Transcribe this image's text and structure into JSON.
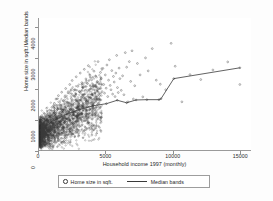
{
  "chart_data": {
    "type": "scatter",
    "title": "",
    "xlabel": "Household income 1997 (monthly)",
    "ylabel": "Home size in sqft./Median bands",
    "xlim": [
      0,
      15800
    ],
    "ylim": [
      0,
      4300
    ],
    "xticks": [
      0,
      5000,
      10000,
      15000
    ],
    "xtick_labels": [
      "0",
      "5000",
      "10000",
      "15000"
    ],
    "yticks": [
      0,
      1000,
      2000,
      3000,
      4000
    ],
    "ytick_labels": [
      "0",
      "1000",
      "2000",
      "3000",
      "4000"
    ],
    "grid": false,
    "legend_position": "below-axes",
    "series": [
      {
        "name": "Home size in sqft.",
        "type": "scatter",
        "marker": "open-circle",
        "color": "#3a3a3a",
        "note": "Dense cloud concentrated at low incomes (0-4000) with home sizes mostly 300-2600 sqft, fanning upward and rightward; sparse outliers extend to ~3800 sqft and incomes to ~15000."
      },
      {
        "name": "Median bands",
        "type": "line",
        "color": "#3a3a3a",
        "x": [
          150,
          1000,
          2000,
          3000,
          4000,
          5000,
          5800,
          6500,
          7200,
          8000,
          8900,
          9050,
          10000,
          14900
        ],
        "y": [
          690,
          960,
          1180,
          1340,
          1460,
          1530,
          1640,
          1560,
          1650,
          1660,
          1660,
          1690,
          2340,
          2690
        ]
      }
    ],
    "scatter_points": {
      "x": [
        120,
        180,
        240,
        300,
        360,
        420,
        480,
        540,
        600,
        660,
        720,
        780,
        840,
        900,
        960,
        1020,
        1080,
        1140,
        1200,
        1260,
        1320,
        1380,
        1440,
        1500,
        1560,
        1620,
        1680,
        1740,
        1800,
        1860,
        1920,
        1980,
        2040,
        2100,
        2160,
        2220,
        2280,
        2340,
        2400,
        2460,
        2520,
        2580,
        2640,
        2700,
        2760,
        2820,
        2880,
        2940,
        3000,
        3060,
        3120,
        3180,
        3240,
        3300,
        3360,
        3420,
        3480,
        3540,
        3600,
        3660,
        3720,
        3780,
        3840,
        3900,
        3960,
        4020,
        4080,
        4140,
        4200,
        4260,
        4320,
        4380,
        4440,
        4500,
        4560,
        4620,
        4680,
        4740,
        4800,
        4860,
        4920,
        4980,
        5040,
        5100,
        5160,
        5220,
        5280,
        5340,
        5400,
        5460,
        5520,
        5580,
        5640,
        5700,
        5760,
        5820,
        5880,
        5940,
        6000,
        6100,
        6200,
        6300,
        6400,
        6500,
        6600,
        6700,
        6800,
        6900,
        7000,
        7100,
        7300,
        7500,
        7700,
        7900,
        8100,
        8400,
        8700,
        9000,
        9400,
        9800,
        10100,
        10600,
        11200,
        12000,
        12900,
        14000,
        14900
      ],
      "y": [
        520,
        640,
        430,
        780,
        900,
        610,
        1050,
        720,
        860,
        1180,
        950,
        1320,
        1090,
        700,
        1410,
        1230,
        880,
        1540,
        1160,
        1680,
        1020,
        1350,
        1790,
        1240,
        950,
        1480,
        1900,
        1310,
        1620,
        1080,
        1750,
        2020,
        1430,
        1190,
        1880,
        1560,
        2150,
        1340,
        1700,
        2280,
        1490,
        1960,
        1250,
        1810,
        2400,
        1620,
        2090,
        1380,
        1930,
        2520,
        1740,
        2210,
        1500,
        2060,
        2640,
        1850,
        2330,
        1610,
        2180,
        2760,
        1970,
        2450,
        1720,
        2300,
        1430,
        2090,
        2580,
        1880,
        2420,
        1650,
        2250,
        2890,
        2010,
        1790,
        2540,
        2340,
        1920,
        2670,
        2150,
        1870,
        2460,
        2030,
        2780,
        1760,
        2290,
        2950,
        2120,
        1980,
        2600,
        1840,
        2410,
        2230,
        1760,
        2520,
        3090,
        2050,
        1890,
        2680,
        2340,
        1960,
        2430,
        1820,
        3180,
        2710,
        1590,
        2890,
        2250,
        3240,
        1680,
        2110,
        2830,
        2460,
        1750,
        3010,
        2590,
        3310,
        2290,
        2160,
        1980,
        3480,
        2740,
        1590,
        2470,
        2310,
        2620,
        2880,
        2150,
        2690
      ]
    }
  },
  "legend": {
    "entries": [
      {
        "label": "Home size in sqft.",
        "marker": "open-circle"
      },
      {
        "label": "Median bands",
        "marker": "line"
      }
    ]
  },
  "axes": {
    "x_label": "Household income 1997 (monthly)",
    "y_label": "Home size in sqft./Median bands"
  }
}
